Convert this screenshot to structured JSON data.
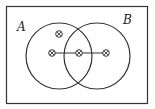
{
  "diagram": {
    "type": "venn",
    "sets": [
      {
        "label": "A",
        "cx": 59,
        "cy": 56,
        "r": 33
      },
      {
        "label": "B",
        "cx": 97,
        "cy": 56,
        "r": 33
      }
    ],
    "labels": {
      "a": "A",
      "b": "B"
    },
    "points": [
      {
        "x": 59,
        "y": 34,
        "region": "A only"
      },
      {
        "x": 52,
        "y": 53,
        "region": "A only"
      },
      {
        "x": 79,
        "y": 53,
        "region": "A and B"
      },
      {
        "x": 106,
        "y": 53,
        "region": "B only"
      }
    ],
    "connector": {
      "x1": 52,
      "x2": 106,
      "y": 53
    },
    "colors": {
      "stroke": "#333333",
      "background": "#ffffff"
    }
  }
}
